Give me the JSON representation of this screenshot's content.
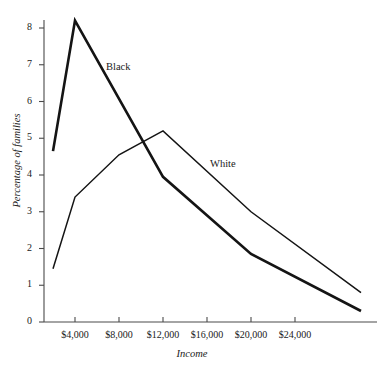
{
  "chart_data": {
    "type": "line",
    "title": "",
    "xlabel": "Income",
    "ylabel": "Percentage of families",
    "xlim": [
      2000,
      30000
    ],
    "ylim": [
      0,
      8.4
    ],
    "grid": false,
    "legend_position": "inline-annotation",
    "x_tick_labels": [
      "$4,000",
      "$8,000",
      "$12,000",
      "$16,000",
      "$20,000",
      "$24,000"
    ],
    "x_tick_values": [
      4000,
      8000,
      12000,
      16000,
      20000,
      24000
    ],
    "y_tick_labels": [
      "0",
      "1",
      "2",
      "3",
      "4",
      "5",
      "6",
      "7",
      "8"
    ],
    "y_tick_values": [
      0,
      1,
      2,
      3,
      4,
      5,
      6,
      7,
      8
    ],
    "series": [
      {
        "name": "Black",
        "label": "Black",
        "color": "#141414",
        "line_width": 2.6,
        "x": [
          2000,
          4000,
          12000,
          20000,
          30000
        ],
        "values": [
          4.65,
          8.2,
          3.95,
          1.85,
          0.3
        ]
      },
      {
        "name": "White",
        "label": "White",
        "color": "#141414",
        "line_width": 1.5,
        "x": [
          2000,
          4000,
          8000,
          12000,
          20000,
          30000
        ],
        "values": [
          1.45,
          3.4,
          4.55,
          5.2,
          3.0,
          0.8
        ]
      }
    ]
  },
  "axes": {
    "y_title": "Percentage of families",
    "x_title": "Income"
  },
  "labels": {
    "black": "Black",
    "white": "White"
  }
}
